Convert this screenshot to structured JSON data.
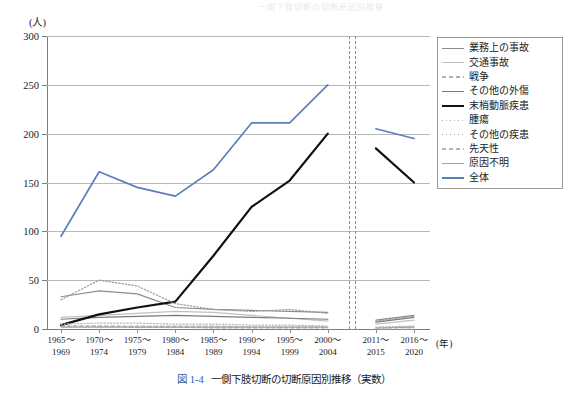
{
  "figure": {
    "bleed_text": "一側下肢切断の切断原因別推移",
    "caption_number": "図 1-4",
    "caption_text": "一側下肢切断の切断原因別推移（実数）",
    "caption_number_color": "#2f5c9e"
  },
  "axes": {
    "y_unit": "(人)",
    "x_unit": "(年)",
    "y_ticks": [
      "0",
      "50",
      "100",
      "150",
      "200",
      "250",
      "300"
    ],
    "x_tick_labels": [
      {
        "top": "1965～",
        "bottom": "1969"
      },
      {
        "top": "1970～",
        "bottom": "1974"
      },
      {
        "top": "1975～",
        "bottom": "1979"
      },
      {
        "top": "1980～",
        "bottom": "1984"
      },
      {
        "top": "1985～",
        "bottom": "1989"
      },
      {
        "top": "1990～",
        "bottom": "1994"
      },
      {
        "top": "1995～",
        "bottom": "1999"
      },
      {
        "top": "2000～",
        "bottom": "2004"
      },
      {
        "top": "2011～",
        "bottom": "2015"
      },
      {
        "top": "2016～",
        "bottom": "2020"
      }
    ]
  },
  "legend": {
    "items": [
      {
        "label": "業務上の事故",
        "color": "#8d8d8d",
        "style": "solid",
        "width": 1.2
      },
      {
        "label": "交通事故",
        "color": "#c0c0c0",
        "style": "solid",
        "width": 1.2
      },
      {
        "label": "戦争",
        "color": "#b0b0b0",
        "style": "dashed",
        "width": 1.2
      },
      {
        "label": "その他の外傷",
        "color": "#7a7a7a",
        "style": "solid",
        "width": 1.2
      },
      {
        "label": "末梢動脈疾患",
        "color": "#111111",
        "style": "solid",
        "width": 2.2
      },
      {
        "label": "腫瘍",
        "color": "#b5b5b5",
        "style": "dotted",
        "width": 1.2
      },
      {
        "label": "その他の疾患",
        "color": "#9a9a9a",
        "style": "dotted",
        "width": 1.2
      },
      {
        "label": "先天性",
        "color": "#b8b8b8",
        "style": "dashed",
        "width": 1.2
      },
      {
        "label": "原因不明",
        "color": "#a3a3a3",
        "style": "solid",
        "width": 1.2
      },
      {
        "label": "全体",
        "color": "#5b7fbd",
        "style": "solid",
        "width": 1.7
      }
    ]
  },
  "chart_data": {
    "type": "line",
    "title": "一側下肢切断の切断原因別推移（実数）",
    "xlabel": "(年)",
    "ylabel": "(人)",
    "ylim": [
      0,
      300
    ],
    "ytick_step": 50,
    "grid": true,
    "legend_position": "right-top",
    "axis_break_after_category_index": 7,
    "categories": [
      "1965～1969",
      "1970～1974",
      "1975～1979",
      "1980～1984",
      "1985～1989",
      "1990～1994",
      "1995～1999",
      "2000～2004",
      "2011～2015",
      "2016～2020"
    ],
    "series": [
      {
        "name": "業務上の事故",
        "color": "#8d8d8d",
        "style": "solid",
        "values": [
          33,
          39,
          36,
          22,
          20,
          19,
          18,
          17,
          9,
          14
        ]
      },
      {
        "name": "交通事故",
        "color": "#c0c0c0",
        "style": "solid",
        "values": [
          12,
          14,
          16,
          18,
          17,
          14,
          11,
          8,
          5,
          9
        ]
      },
      {
        "name": "戦争",
        "color": "#b0b0b0",
        "style": "dashed",
        "values": [
          3,
          3,
          2,
          2,
          1,
          1,
          1,
          1,
          0,
          0
        ]
      },
      {
        "name": "その他の外傷",
        "color": "#7a7a7a",
        "style": "solid",
        "values": [
          10,
          12,
          13,
          14,
          13,
          12,
          11,
          10,
          7,
          12
        ]
      },
      {
        "name": "末梢動脈疾患",
        "color": "#111111",
        "style": "solid",
        "values": [
          4,
          15,
          22,
          28,
          75,
          125,
          152,
          200,
          185,
          150
        ]
      },
      {
        "name": "腫瘍",
        "color": "#b5b5b5",
        "style": "dotted",
        "values": [
          5,
          6,
          6,
          5,
          5,
          4,
          4,
          3,
          2,
          3
        ]
      },
      {
        "name": "その他の疾患",
        "color": "#9a9a9a",
        "style": "dotted",
        "values": [
          30,
          50,
          44,
          26,
          20,
          18,
          20,
          16,
          8,
          13
        ]
      },
      {
        "name": "先天性",
        "color": "#b8b8b8",
        "style": "dashed",
        "values": [
          3,
          3,
          3,
          3,
          3,
          2,
          2,
          2,
          1,
          2
        ]
      },
      {
        "name": "原因不明",
        "color": "#a3a3a3",
        "style": "solid",
        "values": [
          2,
          2,
          2,
          2,
          2,
          2,
          2,
          2,
          1,
          2
        ]
      },
      {
        "name": "全体",
        "color": "#5b7fbd",
        "style": "solid",
        "values": [
          95,
          161,
          145,
          136,
          163,
          211,
          211,
          250,
          205,
          195
        ]
      }
    ]
  }
}
